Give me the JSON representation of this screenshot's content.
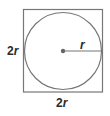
{
  "diagram": {
    "type": "circle-inscribed-in-square",
    "square": {
      "side_label_left": {
        "num": "2",
        "var": "r"
      },
      "side_label_bottom": {
        "num": "2",
        "var": "r"
      }
    },
    "circle": {
      "radius_label": "r"
    },
    "colors": {
      "stroke": "#777777",
      "center_dot": "#666666",
      "text": "#2b2b2b",
      "background": "#ffffff"
    }
  }
}
